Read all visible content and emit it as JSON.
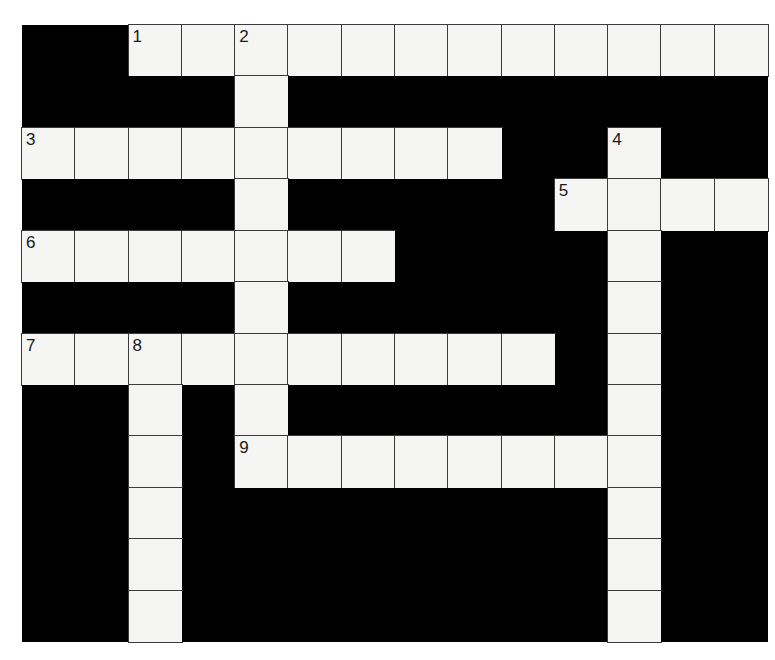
{
  "puzzle": {
    "rows": 12,
    "cols": 14,
    "colors": {
      "block": "#000000",
      "cell": "#f5f5f4",
      "gridline": "#3a3a3a",
      "number": "#1a1a1a"
    },
    "layout": [
      "..############",
      "....#.........",
      "#########..#..",
      "....#.....####",
      "#######....#..",
      "....#......#..",
      "##########.#..",
      "..#.#......#..",
      "..#.########..",
      "..#........#..",
      "..#........#..",
      "..#........#.."
    ],
    "numbers": [
      {
        "n": "1",
        "row": 0,
        "col": 2
      },
      {
        "n": "2",
        "row": 0,
        "col": 4
      },
      {
        "n": "3",
        "row": 2,
        "col": 0
      },
      {
        "n": "4",
        "row": 2,
        "col": 11
      },
      {
        "n": "5",
        "row": 3,
        "col": 10
      },
      {
        "n": "6",
        "row": 4,
        "col": 0
      },
      {
        "n": "7",
        "row": 6,
        "col": 0
      },
      {
        "n": "8",
        "row": 6,
        "col": 2
      },
      {
        "n": "9",
        "row": 8,
        "col": 4
      }
    ],
    "entries": {
      "across": [
        {
          "n": "1",
          "row": 0,
          "col": 2,
          "length": 12
        },
        {
          "n": "3",
          "row": 2,
          "col": 0,
          "length": 9
        },
        {
          "n": "5",
          "row": 3,
          "col": 10,
          "length": 4
        },
        {
          "n": "6",
          "row": 4,
          "col": 0,
          "length": 7
        },
        {
          "n": "7",
          "row": 6,
          "col": 0,
          "length": 10
        },
        {
          "n": "9",
          "row": 8,
          "col": 4,
          "length": 8
        }
      ],
      "down": [
        {
          "n": "2",
          "row": 0,
          "col": 4,
          "length": 9
        },
        {
          "n": "4",
          "row": 2,
          "col": 11,
          "length": 10
        },
        {
          "n": "8",
          "row": 6,
          "col": 2,
          "length": 6
        }
      ]
    }
  }
}
